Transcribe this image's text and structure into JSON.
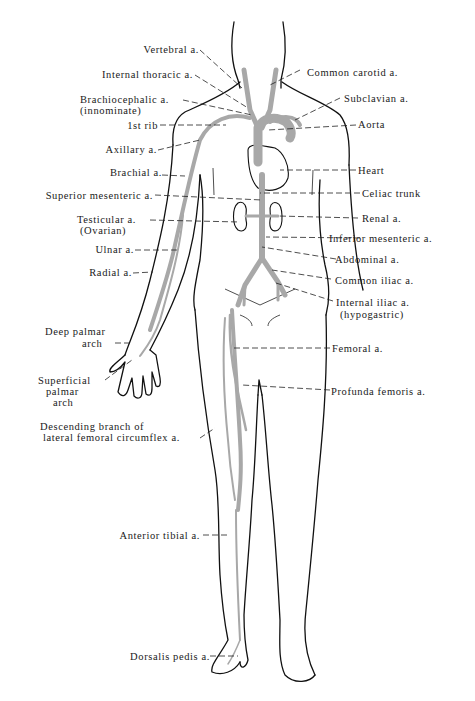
{
  "figure": {
    "colors": {
      "artery": "#a8a8a8",
      "outline": "#111111",
      "background": "#ffffff"
    }
  },
  "labels": {
    "left": [
      {
        "id": "vertebral",
        "text": "Vertebral a."
      },
      {
        "id": "internal-thoracic",
        "text": "Internal thoracic a."
      },
      {
        "id": "brachiocephalic",
        "text": "Brachiocephalic a.",
        "sub": "(innominate)"
      },
      {
        "id": "first-rib",
        "text": "1st rib"
      },
      {
        "id": "axillary",
        "text": "Axillary a."
      },
      {
        "id": "brachial",
        "text": "Brachial a."
      },
      {
        "id": "superior-mesenteric",
        "text": "Superior mesenteric a."
      },
      {
        "id": "testicular",
        "text": "Testicular a.",
        "sub": "(Ovarian)"
      },
      {
        "id": "ulnar",
        "text": "Ulnar a."
      },
      {
        "id": "radial",
        "text": "Radial a."
      },
      {
        "id": "deep-palmar-arch",
        "text": "Deep palmar",
        "sub": "arch"
      },
      {
        "id": "superficial-palmar-arch",
        "text": "Superficial",
        "sub": "palmar",
        "sub2": "arch"
      },
      {
        "id": "descending-branch",
        "text": "Descending branch of",
        "sub": "lateral femoral circumflex a."
      },
      {
        "id": "anterior-tibial",
        "text": "Anterior tibial a."
      },
      {
        "id": "dorsalis-pedis",
        "text": "Dorsalis pedis a."
      }
    ],
    "right": [
      {
        "id": "common-carotid",
        "text": "Common carotid a."
      },
      {
        "id": "subclavian",
        "text": "Subclavian a."
      },
      {
        "id": "aorta",
        "text": "Aorta"
      },
      {
        "id": "heart",
        "text": "Heart"
      },
      {
        "id": "celiac-trunk",
        "text": "Celiac trunk"
      },
      {
        "id": "renal",
        "text": "Renal a."
      },
      {
        "id": "inferior-mesenteric",
        "text": "Inferior mesenteric a."
      },
      {
        "id": "abdominal",
        "text": "Abdominal a."
      },
      {
        "id": "common-iliac",
        "text": "Common iliac a."
      },
      {
        "id": "internal-iliac",
        "text": "Internal iliac a.",
        "sub": "(hypogastric)"
      },
      {
        "id": "femoral",
        "text": "Femoral a."
      },
      {
        "id": "profunda-femoris",
        "text": "Profunda femoris a."
      }
    ]
  }
}
